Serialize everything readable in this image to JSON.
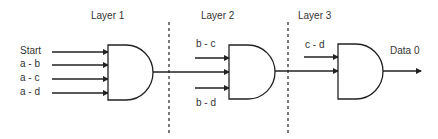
{
  "layers": [
    {
      "label": "Layer 1"
    },
    {
      "label": "Layer 2"
    },
    {
      "label": "Layer 3"
    }
  ],
  "gate1": {
    "inputs": [
      "Start",
      "a - b",
      "a - c",
      "a - d"
    ]
  },
  "gate2": {
    "inputs": [
      "b - c",
      "b - d"
    ]
  },
  "gate3": {
    "inputs": [
      "c - d"
    ]
  },
  "output": {
    "label": "Data 0"
  },
  "colors": {
    "stroke": "#222222",
    "text": "#333333",
    "background": "#ffffff"
  }
}
